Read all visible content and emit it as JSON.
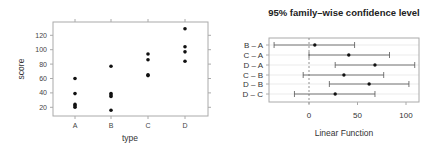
{
  "chart_data": [
    {
      "type": "scatter",
      "title": "",
      "xlabel": "type",
      "ylabel": "score",
      "categories": [
        "A",
        "B",
        "C",
        "D"
      ],
      "points": {
        "A": [
          60,
          39,
          24,
          22,
          20
        ],
        "B": [
          77,
          39,
          37,
          35,
          16
        ],
        "C": [
          94,
          86,
          65,
          64
        ],
        "D": [
          129,
          104,
          97,
          84
        ]
      },
      "yticks": [
        20,
        40,
        60,
        80,
        100,
        120
      ],
      "ylim": [
        10,
        140
      ],
      "grid": false,
      "legend": null
    },
    {
      "type": "errorbar",
      "title": "95% family–wise confidence level",
      "xlabel": "Linear Function",
      "ylabel": "",
      "categories": [
        "B – A",
        "C – A",
        "D – A",
        "C – B",
        "D – B",
        "D – C"
      ],
      "estimate": [
        6,
        41,
        68,
        36,
        62,
        27
      ],
      "lower": [
        -36,
        0,
        27,
        -6,
        21,
        -15
      ],
      "upper": [
        47,
        83,
        109,
        77,
        103,
        68
      ],
      "xticks": [
        0,
        50,
        100
      ],
      "xlim": [
        -41,
        114
      ],
      "reference_line": 0,
      "grid": true,
      "legend": null
    }
  ],
  "left_panel": {
    "ylabel": "score",
    "xlabel": "type",
    "ytick_labels": [
      "20",
      "40",
      "60",
      "80",
      "100",
      "120"
    ],
    "xtick_labels": [
      "A",
      "B",
      "C",
      "D"
    ]
  },
  "right_panel": {
    "title": "95% family–wise confidence level",
    "xlabel": "Linear Function",
    "xtick_labels": [
      "0",
      "50",
      "100"
    ],
    "row_labels": [
      "B – A",
      "C – A",
      "D – A",
      "C – B",
      "D – B",
      "D – C"
    ]
  },
  "colors": {
    "point": "#111111",
    "frame": "#aaaaaa",
    "interval": "#555555",
    "grid": "#e6e6e6",
    "refline": "#777777"
  }
}
